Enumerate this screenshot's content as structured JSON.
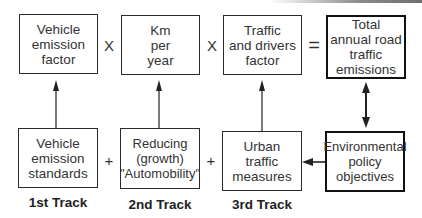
{
  "diagram": {
    "top_row": [
      {
        "id": "vehicle-emission-factor",
        "label": "Vehicle\nemission\nfactor"
      },
      {
        "id": "km-per-year",
        "label": "Km\nper\nyear"
      },
      {
        "id": "traffic-drivers-factor",
        "label": "Traffic\nand drivers\nfactor"
      },
      {
        "id": "total-emissions",
        "label": "Total\nannual road\ntraffic\nemissions"
      }
    ],
    "top_operators": [
      "X",
      "X",
      "="
    ],
    "bottom_row": [
      {
        "id": "vehicle-emission-standards",
        "label": "Vehicle\nemission\nstandards"
      },
      {
        "id": "reducing-automobility",
        "label": "Reducing\n(growth)\n\"Automobility\""
      },
      {
        "id": "urban-traffic-measures",
        "label": "Urban\ntraffic\nmeasures"
      },
      {
        "id": "environmental-policy-objectives",
        "label": "Environmental\npolicy\nobjectives"
      }
    ],
    "bottom_operators": [
      "+",
      "+"
    ],
    "tracks": [
      "1st Track",
      "2nd Track",
      "3rd Track"
    ],
    "connections": [
      {
        "from": "vehicle-emission-standards",
        "to": "vehicle-emission-factor",
        "type": "arrow-up"
      },
      {
        "from": "reducing-automobility",
        "to": "km-per-year",
        "type": "arrow-up"
      },
      {
        "from": "urban-traffic-measures",
        "to": "traffic-drivers-factor",
        "type": "arrow-up"
      },
      {
        "from": "total-emissions",
        "to": "environmental-policy-objectives",
        "type": "double-arrow"
      },
      {
        "from": "environmental-policy-objectives",
        "to": "urban-traffic-measures",
        "type": "arrow-left"
      }
    ]
  }
}
